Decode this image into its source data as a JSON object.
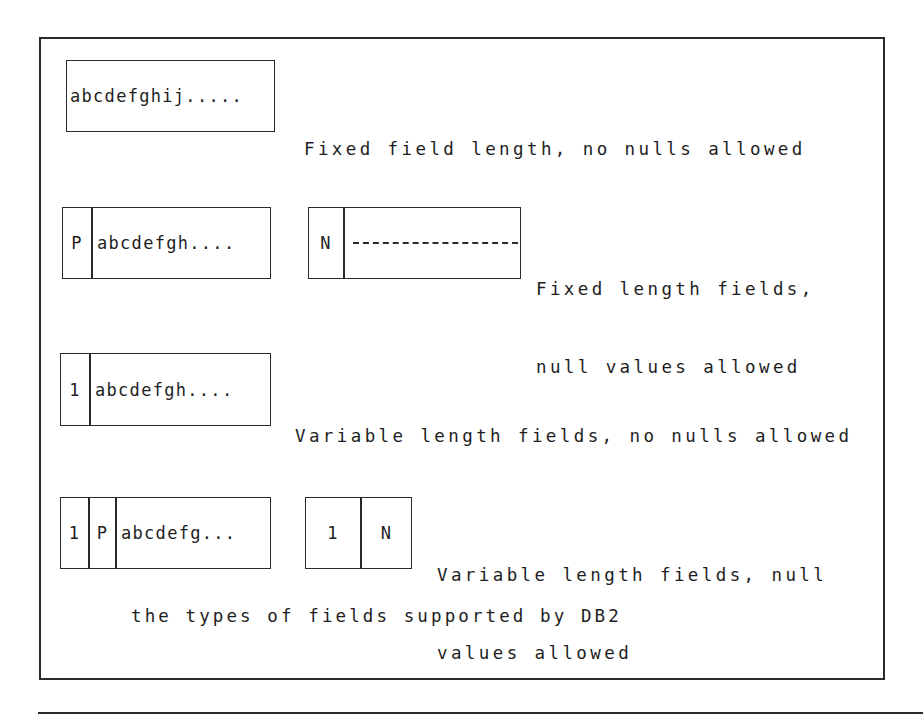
{
  "title": "the types of fields supported by DB2",
  "colors": {
    "ink": "#2a2a2a",
    "background": "#ffffff"
  },
  "rows": [
    {
      "boxes": [
        {
          "cells": [
            {
              "text": "abcdefghij....."
            }
          ]
        }
      ],
      "label_lines": [
        "Fixed field length, no nulls allowed"
      ]
    },
    {
      "boxes": [
        {
          "cells": [
            {
              "text": "P"
            },
            {
              "text": "abcdefgh...."
            }
          ]
        },
        {
          "cells": [
            {
              "text": "N"
            },
            {
              "text": "------------"
            }
          ]
        }
      ],
      "label_lines": [
        "Fixed length fields,",
        "null values allowed"
      ]
    },
    {
      "boxes": [
        {
          "cells": [
            {
              "text": "1"
            },
            {
              "text": "abcdefgh...."
            }
          ]
        }
      ],
      "label_lines": [
        "Variable length fields, no nulls allowed"
      ]
    },
    {
      "boxes": [
        {
          "cells": [
            {
              "text": "1"
            },
            {
              "text": "P"
            },
            {
              "text": "abcdefg..."
            }
          ]
        },
        {
          "cells": [
            {
              "text": "1"
            },
            {
              "text": "N"
            }
          ]
        }
      ],
      "label_lines": [
        "Variable length fields, null",
        "values allowed"
      ]
    }
  ]
}
